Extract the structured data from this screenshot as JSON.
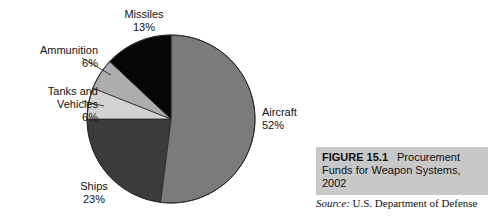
{
  "chart_data": {
    "type": "pie",
    "title": "Procurement Funds for Weapon Systems, 2002",
    "categories": [
      "Aircraft",
      "Ships",
      "Tanks and Vehicles",
      "Ammunition",
      "Missiles"
    ],
    "values": [
      52,
      23,
      6,
      6,
      13
    ],
    "value_suffix": "%",
    "start_angle_deg": 0,
    "direction": "clockwise",
    "legend": "none",
    "grid": false,
    "slice_colors": [
      "#7b7b7b",
      "#3b3b3b",
      "#d2d2d2",
      "#adadad",
      "#060606"
    ],
    "outline_color": "#2a2a2a",
    "background": "#ffffff",
    "slices": [
      {
        "label": "Aircraft",
        "percent_label": "52%",
        "value": 52,
        "color": "#7b7b7b",
        "leader": false
      },
      {
        "label": "Ships",
        "percent_label": "23%",
        "value": 23,
        "color": "#3b3b3b",
        "leader": false
      },
      {
        "label": "Tanks and Vehicles",
        "percent_label": "6%",
        "value": 6,
        "color": "#d2d2d2",
        "leader": true
      },
      {
        "label": "Ammunition",
        "percent_label": "6%",
        "value": 6,
        "color": "#adadad",
        "leader": true
      },
      {
        "label": "Missiles",
        "percent_label": "13%",
        "value": 13,
        "color": "#060606",
        "leader": false
      }
    ]
  },
  "labels": {
    "missiles": {
      "name": "Missiles",
      "pct": "13%"
    },
    "ammunition": {
      "name": "Ammunition",
      "pct": "6%"
    },
    "tanks": {
      "name": "Tanks and",
      "name2": "Vehicles",
      "pct": "6%"
    },
    "ships": {
      "name": "Ships",
      "pct": "23%"
    },
    "aircraft": {
      "name": "Aircraft",
      "pct": "52%"
    }
  },
  "caption": {
    "figure_number": "FIGURE 15.1",
    "text": "Procurement Funds for Weapon Systems, 2002",
    "background_color": "#c8c8c8"
  },
  "source": {
    "keyword": "Source:",
    "text": "U.S. Department of Defense"
  }
}
